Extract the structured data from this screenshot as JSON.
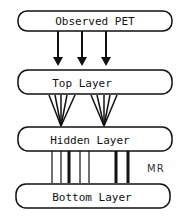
{
  "diagram": {
    "boxes": [
      {
        "id": "observed",
        "label": "Observed PET"
      },
      {
        "id": "top",
        "label": "Top Layer"
      },
      {
        "id": "hidden",
        "label": "Hidden Layer"
      },
      {
        "id": "bottom",
        "label": "Bottom Layer"
      }
    ],
    "side_label": "MR",
    "colors": {
      "stroke": "#111111",
      "background": "#ffffff"
    }
  }
}
